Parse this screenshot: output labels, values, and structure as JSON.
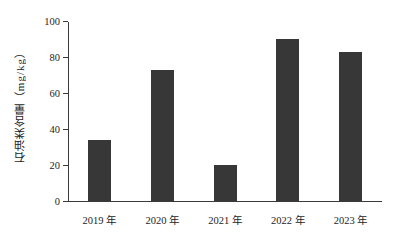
{
  "chart_data": {
    "type": "bar",
    "title": "",
    "subtitle": "",
    "xlabel": "",
    "ylabel": "石油类含量（mg/kg）",
    "categories": [
      "2019 年",
      "2020 年",
      "2021 年",
      "2022 年",
      "2023 年"
    ],
    "values": [
      34,
      73,
      20,
      90,
      83
    ],
    "ylim": [
      0,
      100
    ],
    "yticks": [
      0,
      20,
      40,
      60,
      80,
      100
    ],
    "ytick_labels": [
      "0",
      "20",
      "40",
      "60",
      "80",
      "100"
    ],
    "grid": false,
    "legend": null,
    "bar_color": "#373737",
    "axis_color": "#3a3a3a",
    "background_color": "#ffffff",
    "series": [
      {
        "name": "石油类含量",
        "values": [
          34,
          73,
          20,
          90,
          83
        ]
      }
    ]
  },
  "figure": {
    "y_axis_title": "石油类含量（mg/kg）"
  }
}
